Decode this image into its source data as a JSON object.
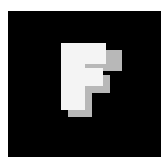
{
  "icon": {
    "name": "letter-f-icon",
    "letter": "F",
    "colors": {
      "background": "#000000",
      "glyph": "#f4f4f4",
      "shadow": "#b8b8b8",
      "page": "#ffffff"
    }
  }
}
